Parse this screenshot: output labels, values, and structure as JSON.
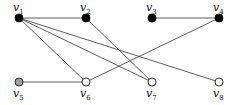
{
  "graph": {
    "nodes": [
      {
        "id": "v1",
        "name": "v",
        "sub": "1",
        "x": 19,
        "y": 18,
        "fill": "#000000",
        "label_pos": "above"
      },
      {
        "id": "v2",
        "name": "v",
        "sub": "2",
        "x": 86,
        "y": 18,
        "fill": "#000000",
        "label_pos": "above"
      },
      {
        "id": "v3",
        "name": "v",
        "sub": "3",
        "x": 152,
        "y": 18,
        "fill": "#000000",
        "label_pos": "above"
      },
      {
        "id": "v4",
        "name": "v",
        "sub": "4",
        "x": 219,
        "y": 18,
        "fill": "#000000",
        "label_pos": "above"
      },
      {
        "id": "v5",
        "name": "v",
        "sub": "5",
        "x": 19,
        "y": 82,
        "fill": "#a0a0a0",
        "label_pos": "below"
      },
      {
        "id": "v6",
        "name": "v",
        "sub": "6",
        "x": 86,
        "y": 82,
        "fill": "#ffffff",
        "label_pos": "below"
      },
      {
        "id": "v7",
        "name": "v",
        "sub": "7",
        "x": 152,
        "y": 82,
        "fill": "#ffffff",
        "label_pos": "below"
      },
      {
        "id": "v8",
        "name": "v",
        "sub": "8",
        "x": 219,
        "y": 82,
        "fill": "#ffffff",
        "label_pos": "below"
      }
    ],
    "edges": [
      [
        "v1",
        "v2"
      ],
      [
        "v3",
        "v4"
      ],
      [
        "v5",
        "v6"
      ],
      [
        "v1",
        "v6"
      ],
      [
        "v1",
        "v7"
      ],
      [
        "v1",
        "v8"
      ],
      [
        "v2",
        "v7"
      ],
      [
        "v4",
        "v6"
      ]
    ]
  }
}
